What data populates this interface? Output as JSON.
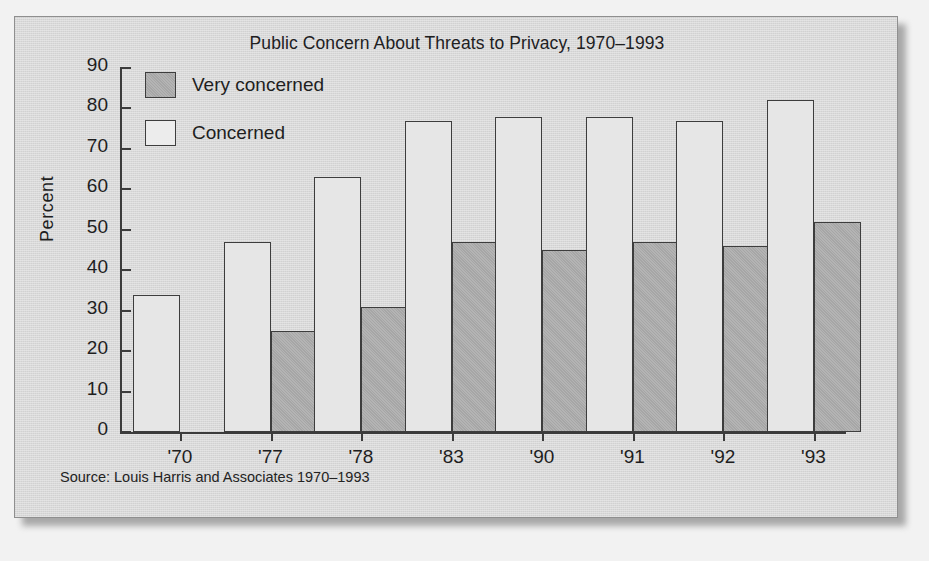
{
  "figure": {
    "title": "Public Concern About Threats to Privacy, 1970–1993",
    "source_note": "Source: Louis Harris and Associates 1970–1993",
    "y_axis_title": "Percent",
    "legend": [
      {
        "label": "Very concerned",
        "swatch": "gray-filled-square",
        "color": "#a6a6a6"
      },
      {
        "label": "Concerned",
        "swatch": "white-outlined-square",
        "color": "#ececec"
      }
    ],
    "colors": {
      "panel_background": "#d9d9d9",
      "page_background": "#f2f2f2",
      "axis": "#3b3b3b",
      "very_concerned_fill": "#a6a6a6",
      "concerned_fill": "#e6e6e6",
      "bar_outline": "#3d3d3d",
      "text": "#1e1e1e"
    }
  },
  "chart_data": {
    "type": "bar",
    "title": "Public Concern About Threats to Privacy, 1970–1993",
    "xlabel": "",
    "ylabel": "Percent",
    "categories": [
      "'70",
      "'77",
      "'78",
      "'83",
      "'90",
      "'91",
      "'92",
      "'93"
    ],
    "series": [
      {
        "name": "Concerned",
        "values": [
          34,
          47,
          63,
          77,
          78,
          78,
          77,
          82
        ]
      },
      {
        "name": "Very concerned",
        "values": [
          null,
          25,
          31,
          47,
          45,
          47,
          46,
          52
        ]
      }
    ],
    "ylim": [
      0,
      90
    ],
    "ytick_labels": [
      "0",
      "10",
      "20",
      "30",
      "40",
      "50",
      "60",
      "70",
      "80",
      "90"
    ],
    "ytick_values": [
      0,
      10,
      20,
      30,
      40,
      50,
      60,
      70,
      80,
      90
    ],
    "grid": false,
    "legend_position": "upper-left-inside"
  }
}
